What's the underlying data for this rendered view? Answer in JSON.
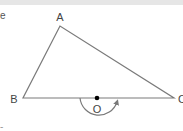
{
  "figure": {
    "type": "geometry-diagram",
    "colors": {
      "line": "#7a7a7a",
      "label": "#444444",
      "point": "#000000",
      "top_band": "#e6e6e6"
    },
    "vertices": [
      {
        "label": "A",
        "x": 60,
        "y": 26,
        "label_x": 60,
        "label_y": 18
      },
      {
        "label": "B",
        "x": 23,
        "y": 98,
        "label_x": 15,
        "label_y": 98
      },
      {
        "label": "C",
        "x": 174,
        "y": 98,
        "label_x": 181,
        "label_y": 98
      }
    ],
    "center_point": {
      "label": "O",
      "x": 97,
      "y": 98,
      "label_x": 97,
      "label_y": 109
    },
    "rotation_arc": {
      "direction": "counterclockwise-below",
      "from_x": 80,
      "to_x": 118,
      "bottom_y": 118
    },
    "fragments": {
      "left_top": "e",
      "left_bottom": "-"
    }
  }
}
